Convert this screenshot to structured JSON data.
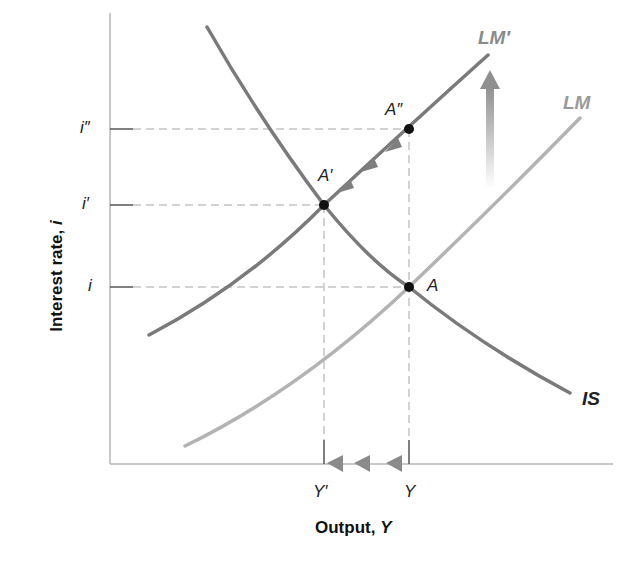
{
  "figure": {
    "x_axis_title": "Output, ",
    "x_axis_var": "Y",
    "y_axis_title": "Interest rate, ",
    "y_axis_var": "i"
  },
  "ticks": {
    "y": [
      {
        "label": "i″",
        "y": 129
      },
      {
        "label": "i′",
        "y": 205
      },
      {
        "label": "i",
        "y": 287
      }
    ],
    "x": [
      {
        "label": "Y′",
        "x": 324
      },
      {
        "label": "Y",
        "x": 409
      }
    ]
  },
  "curves": {
    "is": {
      "label": "IS",
      "color": "#7a7a7a"
    },
    "lm": {
      "label": "LM",
      "color": "#b0b0b0"
    },
    "lm_prime": {
      "label": "LM′",
      "color": "#7a7a7a"
    }
  },
  "points": {
    "a": {
      "label": "A"
    },
    "a_prime": {
      "label": "A′"
    },
    "a_double_prime": {
      "label": "A″"
    }
  },
  "colors": {
    "axis": "#c8c8c8",
    "guide": "#c0c0c0",
    "arrow": "#8a8a8a",
    "point": "#111111"
  }
}
